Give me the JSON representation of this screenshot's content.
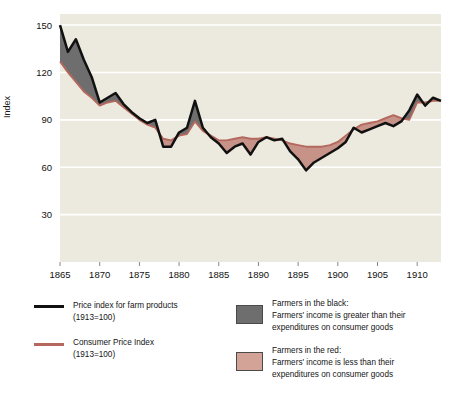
{
  "chart_data": {
    "type": "line",
    "title": "",
    "xlabel": "",
    "ylabel": "Index",
    "xlim": [
      1865,
      1913
    ],
    "ylim": [
      0,
      157
    ],
    "yticks": [
      30,
      60,
      90,
      120,
      150
    ],
    "xticks": [
      1865,
      1870,
      1875,
      1880,
      1885,
      1890,
      1895,
      1900,
      1905,
      1910
    ],
    "grid": "horizontal",
    "legend_position": "below",
    "x": [
      1865,
      1866,
      1867,
      1868,
      1869,
      1870,
      1871,
      1872,
      1873,
      1874,
      1875,
      1876,
      1877,
      1878,
      1879,
      1880,
      1881,
      1882,
      1883,
      1884,
      1885,
      1886,
      1887,
      1888,
      1889,
      1890,
      1891,
      1892,
      1893,
      1894,
      1895,
      1896,
      1897,
      1898,
      1899,
      1900,
      1901,
      1902,
      1903,
      1904,
      1905,
      1906,
      1907,
      1908,
      1909,
      1910,
      1911,
      1912,
      1913
    ],
    "series": [
      {
        "name": "Price index for farm products (1913=100)",
        "color": "#111111",
        "values": [
          150,
          133,
          141,
          128,
          117,
          101,
          104,
          107,
          100,
          95,
          91,
          88,
          90,
          73,
          73,
          82,
          85,
          102,
          85,
          79,
          75,
          69,
          73,
          75,
          68,
          76,
          79,
          77,
          78,
          70,
          65,
          58,
          63,
          66,
          69,
          72,
          76,
          85,
          82,
          84,
          86,
          88,
          86,
          89,
          96,
          106,
          99,
          104,
          102
        ]
      },
      {
        "name": "Consumer Price Index (1913=100)",
        "color": "#b4685e",
        "values": [
          127,
          120,
          114,
          108,
          104,
          99,
          101,
          102,
          98,
          94,
          90,
          87,
          85,
          78,
          77,
          80,
          81,
          89,
          83,
          80,
          77,
          77,
          78,
          79,
          78,
          78,
          79,
          78,
          77,
          75,
          74,
          73,
          73,
          73,
          74,
          76,
          80,
          84,
          87,
          88,
          89,
          91,
          93,
          91,
          90,
          101,
          101,
          102,
          102
        ]
      }
    ],
    "fills": [
      {
        "name": "Farmers in the black",
        "color": "#6e6e6e"
      },
      {
        "name": "Farmers in the red",
        "color": "#c79288"
      }
    ],
    "plot_bgcolor": "#eceade"
  },
  "axis": {
    "ylabel": "Index",
    "yticklabels": [
      "150",
      "120",
      "90",
      "60",
      "30"
    ],
    "xticklabels": [
      "1865",
      "1870",
      "1875",
      "1880",
      "1885",
      "1890",
      "1895",
      "1900",
      "1905",
      "1910"
    ]
  },
  "legend": {
    "items_left": [
      {
        "marker": "black-line",
        "line1": "Price index for farm products",
        "line2": "(1913=100)"
      },
      {
        "marker": "red-line",
        "line1": "Consumer Price Index",
        "line2": "(1913=100)"
      }
    ],
    "items_right": [
      {
        "marker": "gray-swatch",
        "title": "Farmers in the black:",
        "line1": "Farmers' income is greater than their",
        "line2": "expenditures on consumer goods"
      },
      {
        "marker": "pink-swatch",
        "title": "Farmers in the red:",
        "line1": "Farmers' income is less than their",
        "line2": "expenditures on consumer goods"
      }
    ]
  }
}
